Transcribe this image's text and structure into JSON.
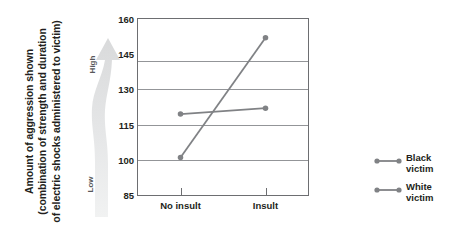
{
  "chart_data": {
    "type": "line",
    "title": "",
    "subtitle": "",
    "xlabel": "",
    "ylabel": "Amount of aggression shown (combination of strength and duration of electric shocks administered to victim)",
    "categories": [
      "No insult",
      "Insult"
    ],
    "ylim": [
      85,
      160
    ],
    "yticks": [
      85,
      100,
      115,
      130,
      145,
      160
    ],
    "grid": true,
    "legend_position": "right",
    "series": [
      {
        "name": "Black victim",
        "values": [
          119.5,
          122.0
        ],
        "color": "#808285",
        "marker": "circle"
      },
      {
        "name": "White victim",
        "values": [
          101.0,
          152.0
        ],
        "color": "#808285",
        "marker": "circle"
      }
    ],
    "annotations": [
      {
        "name": "scale-arrow-high",
        "text": "High"
      },
      {
        "name": "scale-arrow-low",
        "text": "Low"
      }
    ]
  },
  "axis": {
    "y_caption_line1": "Amount of aggression shown",
    "y_caption_line2": "(combination of strength and duration",
    "y_caption_line3": "of electric shocks administered to victim)",
    "y_tick_0": "85",
    "y_tick_1": "100",
    "y_tick_2": "115",
    "y_tick_3": "130",
    "y_tick_4": "145",
    "y_tick_5": "160",
    "x_tick_0": "No insult",
    "x_tick_1": "Insult"
  },
  "arrow": {
    "high_label": "High",
    "low_label": "Low"
  },
  "legend": {
    "entries": [
      {
        "label_line1": "Black",
        "label_line2": "victim"
      },
      {
        "label_line1": "White",
        "label_line2": "victim"
      }
    ]
  },
  "colors": {
    "series_gray": "#808285",
    "gridline": "#939598",
    "frame": "#6d6e71",
    "arrow_fill": "#e6e7e8",
    "text": "#231f20"
  }
}
